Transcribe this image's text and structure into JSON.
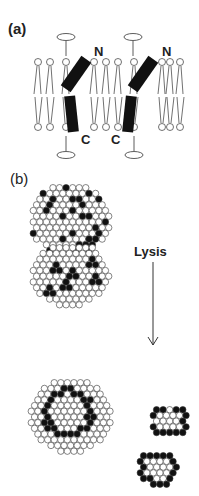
{
  "panel_a": {
    "label": "(a)",
    "n_left": "N",
    "n_right": "N",
    "c_left": "C",
    "c_right": "C"
  },
  "panel_b": {
    "label": "(b)",
    "arrow_label": "Lysis"
  }
}
